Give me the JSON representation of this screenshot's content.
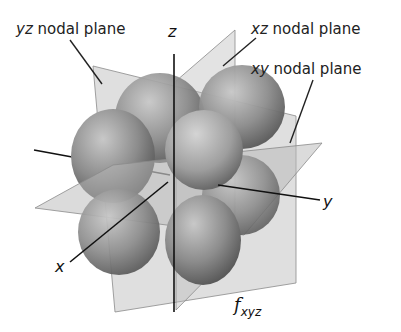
{
  "labels": {
    "yz_plane": {
      "var": "yz",
      "text": " nodal plane"
    },
    "xz_plane": {
      "var": "xz",
      "text": " nodal plane"
    },
    "xy_plane": {
      "var": "xy",
      "text": " nodal plane"
    },
    "axis_x": "x",
    "axis_y": "y",
    "axis_z": "z",
    "orbital_main": "f",
    "orbital_sub": "xyz"
  },
  "colors": {
    "plane_fill": "#b8b8b8",
    "plane_edge": "#8a8a8a",
    "lobe_light": "#c4c4c4",
    "lobe_dark": "#5e5e5e",
    "axis": "#111111",
    "text": "#222222"
  }
}
